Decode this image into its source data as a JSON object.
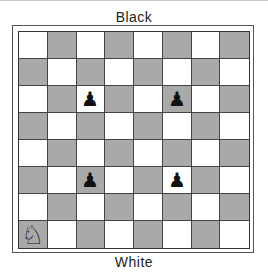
{
  "labels": {
    "top": "Black",
    "bottom": "White"
  },
  "colors": {
    "light": "#ffffff",
    "dark": "#a9a9a9"
  },
  "board": {
    "files": [
      "a",
      "b",
      "c",
      "d",
      "e",
      "f",
      "g",
      "h"
    ],
    "ranks": [
      8,
      7,
      6,
      5,
      4,
      3,
      2,
      1
    ],
    "pieces": [
      {
        "square": "c6",
        "piece": "black-pawn",
        "glyph": "♟"
      },
      {
        "square": "f6",
        "piece": "black-pawn",
        "glyph": "♟"
      },
      {
        "square": "c3",
        "piece": "black-pawn",
        "glyph": "♟"
      },
      {
        "square": "f3",
        "piece": "black-pawn",
        "glyph": "♟"
      },
      {
        "square": "a1",
        "piece": "white-knight",
        "glyph": "♘"
      }
    ]
  }
}
